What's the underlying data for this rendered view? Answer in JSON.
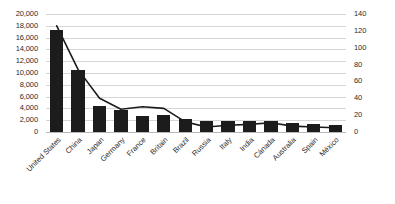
{
  "chart_data": {
    "type": "bar",
    "title": "",
    "subtitle": "",
    "xlabel": "",
    "ylabel": "",
    "y2label": "",
    "grid": true,
    "legend": "none",
    "categories": [
      "United States",
      "China",
      "Japan",
      "Germany",
      "France",
      "Britain",
      "Brazil",
      "Russia",
      "Italy",
      "India",
      "Cánada",
      "Australia",
      "Spain",
      "México"
    ],
    "ylim": [
      0,
      20000
    ],
    "y2lim": [
      0,
      140
    ],
    "yticks": [
      "0",
      "2,000",
      "4,000",
      "6,000",
      "8,000",
      "10,000",
      "12,000",
      "14,000",
      "16,000",
      "18,000",
      "20,000"
    ],
    "ytick_values": [
      0,
      2000,
      4000,
      6000,
      8000,
      10000,
      12000,
      14000,
      16000,
      18000,
      20000
    ],
    "y2ticks": [
      "0",
      "20",
      "40",
      "60",
      "80",
      "100",
      "120",
      "140"
    ],
    "y2tick_values": [
      0,
      20,
      40,
      60,
      80,
      100,
      120,
      140
    ],
    "series": [
      {
        "name": "bars",
        "kind": "bar",
        "axis": "left",
        "color": "#1c1c1c",
        "values": [
          17300,
          10500,
          4400,
          3800,
          2750,
          2900,
          2250,
          1850,
          1800,
          1900,
          1800,
          1550,
          1350,
          1200
        ]
      },
      {
        "name": "line",
        "kind": "line",
        "axis": "right",
        "color": "#1c1c1c",
        "values": [
          126,
          74,
          40,
          27,
          30,
          28,
          12,
          6,
          8,
          9,
          11,
          7,
          6,
          5
        ]
      }
    ]
  },
  "axis_left": {
    "name": "primary-value-axis"
  },
  "axis_right": {
    "name": "secondary-value-axis"
  }
}
